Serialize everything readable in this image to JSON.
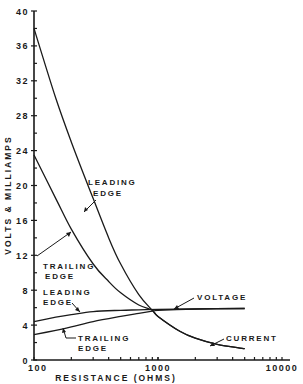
{
  "chart_data": {
    "type": "line",
    "title": "",
    "xlabel": "RESISTANCE (OHMS)",
    "ylabel": "VOLTS & MILLIAMPS",
    "xscale": "log",
    "xlim": [
      100,
      10000
    ],
    "ylim": [
      0,
      40
    ],
    "x_tick_labels": [
      "100",
      "1000",
      "10000"
    ],
    "y_tick_labels": [
      "0",
      "4",
      "8",
      "12",
      "16",
      "20",
      "24",
      "28",
      "32",
      "36",
      "40"
    ],
    "grid": false,
    "series": [
      {
        "name": "Current - Leading Edge",
        "x": [
          100,
          150,
          200,
          300,
          400,
          500,
          700,
          900,
          1000,
          1500,
          2000,
          3000,
          5000
        ],
        "values": [
          38,
          30,
          25,
          18.5,
          14,
          11,
          7.5,
          5.7,
          5.0,
          3.3,
          2.5,
          1.8,
          1.3
        ]
      },
      {
        "name": "Current - Trailing Edge",
        "x": [
          100,
          150,
          200,
          300,
          400,
          500,
          700,
          900,
          1000,
          1500,
          2000,
          3000,
          5000
        ],
        "values": [
          23.5,
          18.5,
          15,
          11,
          9,
          7.7,
          6.3,
          5.7,
          5.0,
          3.3,
          2.5,
          1.8,
          1.3
        ]
      },
      {
        "name": "Voltage - Leading Edge",
        "x": [
          100,
          150,
          200,
          300,
          500,
          700,
          1000,
          2000,
          5000
        ],
        "values": [
          4.4,
          4.9,
          5.2,
          5.55,
          5.7,
          5.75,
          5.8,
          5.85,
          5.9
        ]
      },
      {
        "name": "Voltage - Trailing Edge",
        "x": [
          100,
          150,
          200,
          300,
          500,
          700,
          900,
          1000,
          2000,
          5000
        ],
        "values": [
          2.9,
          3.4,
          3.8,
          4.4,
          5.0,
          5.35,
          5.6,
          5.7,
          5.85,
          5.9
        ]
      }
    ],
    "annotations": [
      {
        "text": [
          "LEADING",
          "EDGE"
        ],
        "target": "Current - Leading Edge"
      },
      {
        "text": [
          "TRAILING",
          "EDGE"
        ],
        "target": "Current - Trailing Edge"
      },
      {
        "text": [
          "LEADING",
          "EDGE"
        ],
        "target": "Voltage - Leading Edge"
      },
      {
        "text": [
          "TRAILING",
          "EDGE"
        ],
        "target": "Voltage - Trailing Edge"
      },
      {
        "text": [
          "VOLTAGE"
        ],
        "target": "Voltage curves"
      },
      {
        "text": [
          "CURRENT"
        ],
        "target": "Current curves"
      }
    ]
  },
  "labels": {
    "ylabel": "VOLTS & MILLIAMPS",
    "xlabel": "RESISTANCE (OHMS)",
    "x_ticks": [
      "100",
      "1000",
      "10000"
    ],
    "y_ticks": [
      "0",
      "4",
      "8",
      "12",
      "16",
      "20",
      "24",
      "28",
      "32",
      "36",
      "40"
    ],
    "annot_leading_current": [
      "LEADING",
      "EDGE"
    ],
    "annot_trailing_current": [
      "TRAILING",
      "EDGE"
    ],
    "annot_leading_voltage": [
      "LEADING",
      "EDGE"
    ],
    "annot_trailing_voltage": [
      "TRAILING",
      "EDGE"
    ],
    "annot_voltage": "VOLTAGE",
    "annot_current": "CURRENT"
  }
}
